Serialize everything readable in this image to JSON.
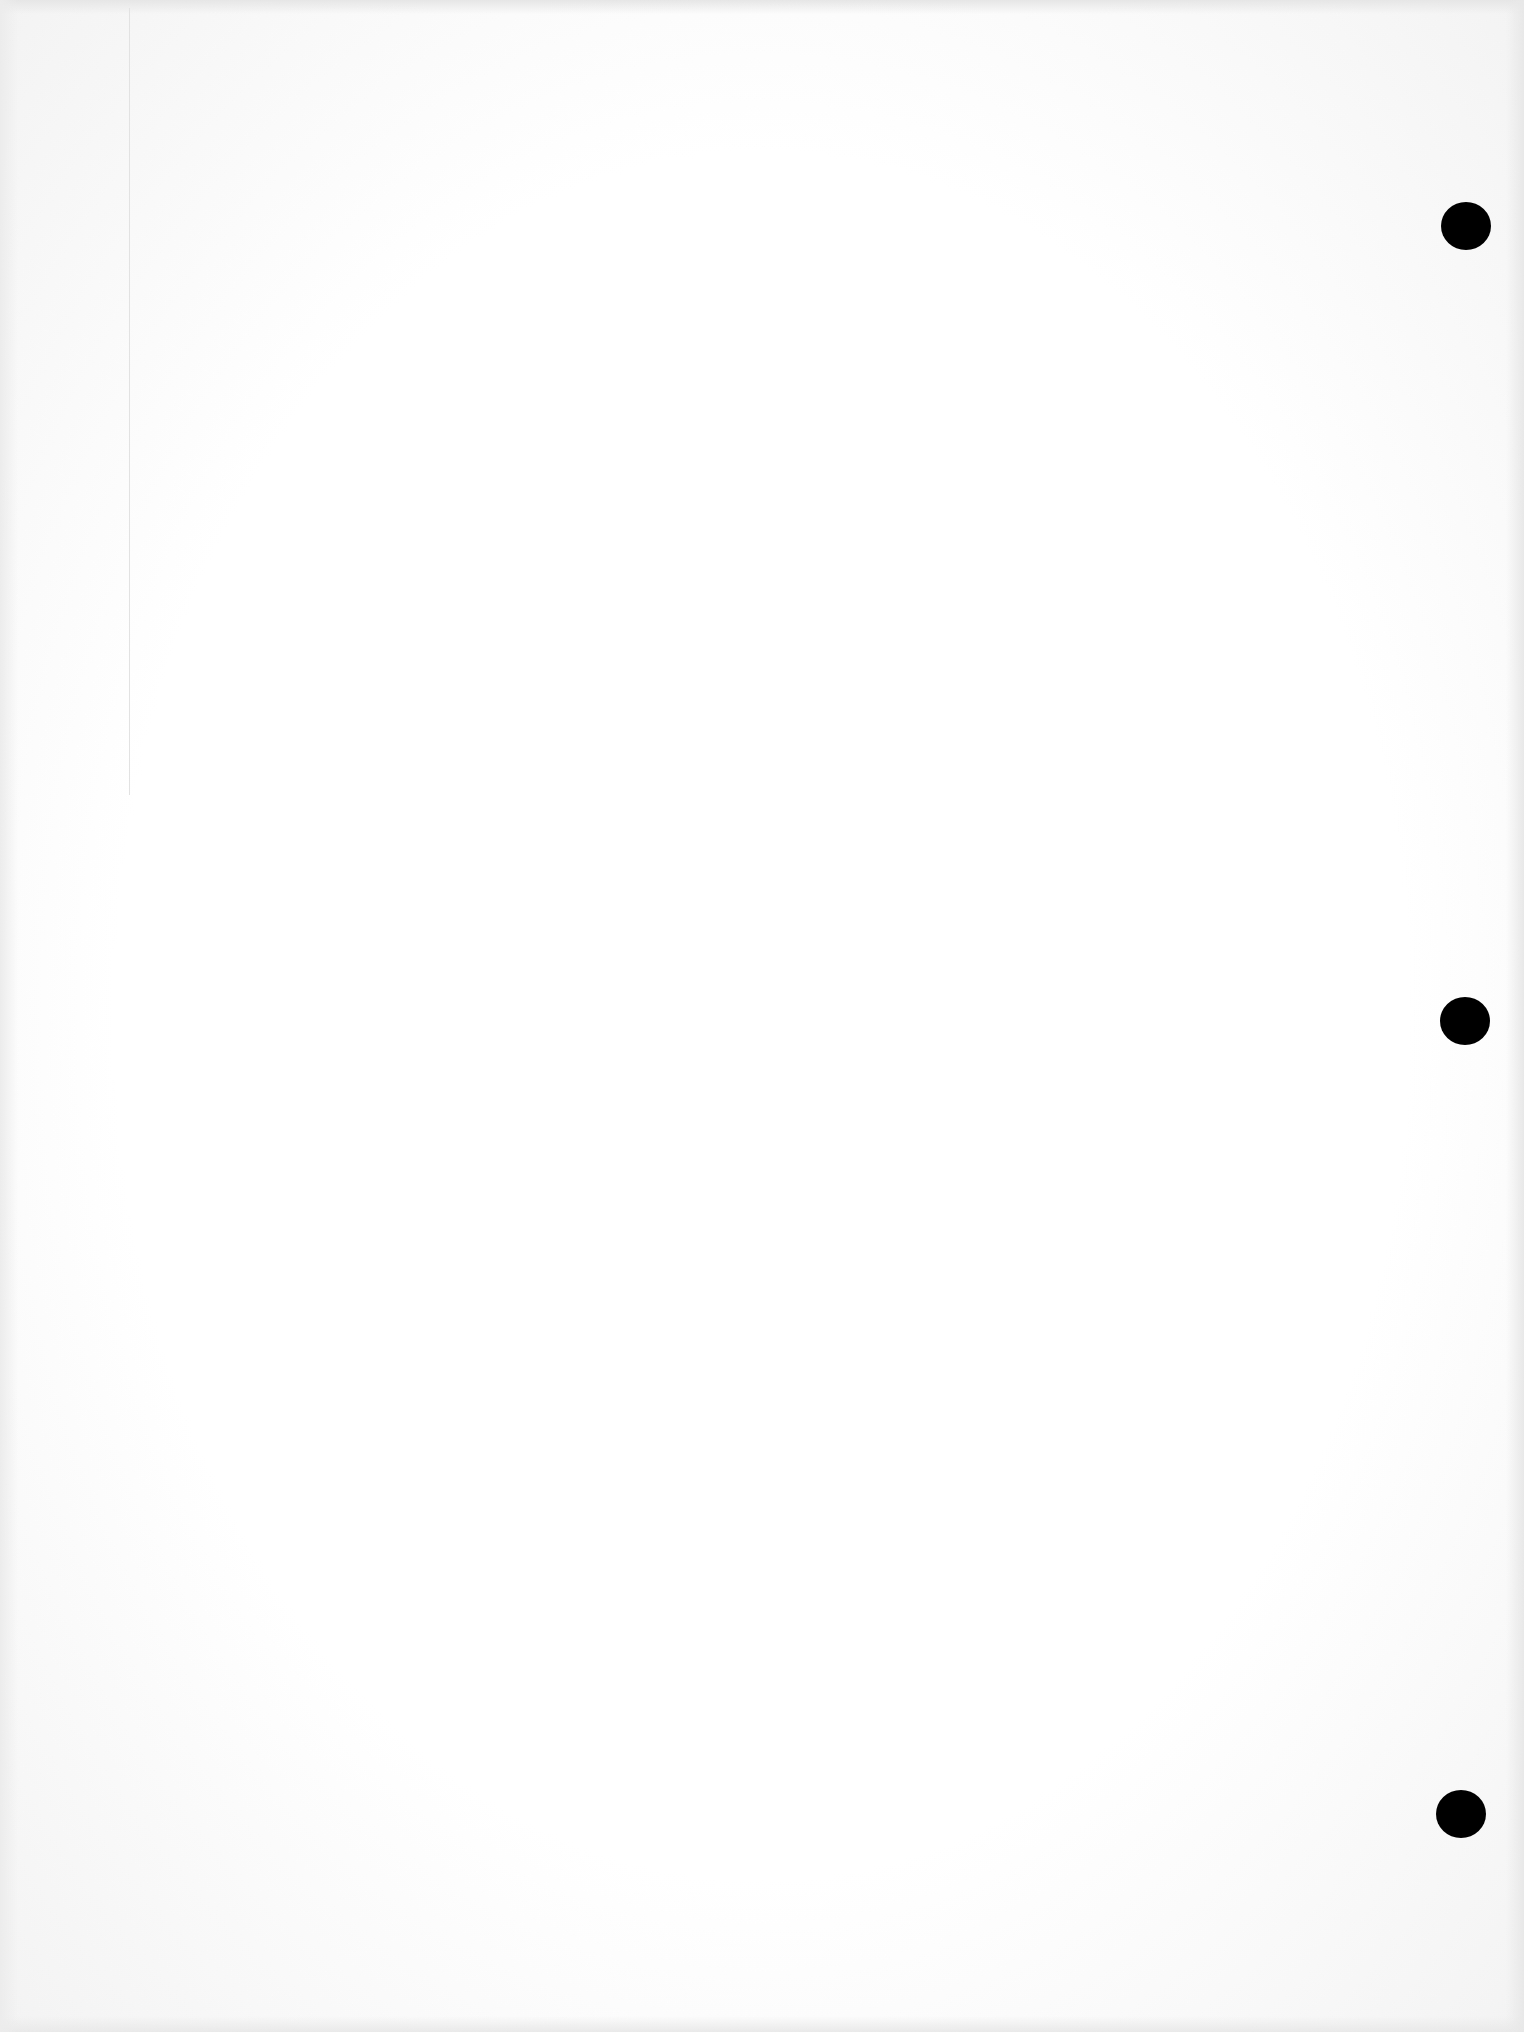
{
  "document": {
    "type": "blank-paper-sheet",
    "content_text": "",
    "background_color": "#fdfdfd",
    "margin_line": {
      "x": 129,
      "color": "#e2e2e2"
    },
    "punch_holes": [
      {
        "name": "top",
        "center": [
          1466,
          226
        ],
        "color": "#000000"
      },
      {
        "name": "middle",
        "center": [
          1465,
          1021
        ],
        "color": "#000000"
      },
      {
        "name": "bottom",
        "center": [
          1461,
          1814
        ],
        "color": "#000000"
      }
    ]
  }
}
